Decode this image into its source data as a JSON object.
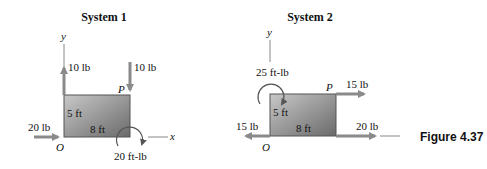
{
  "figure_label": "Figure 4.37",
  "systems": [
    {
      "title": "System 1",
      "axes": {
        "x": "x",
        "y": "y",
        "origin": "O",
        "point": "P"
      },
      "dims": {
        "height": "5 ft",
        "width": "8 ft"
      },
      "forces": [
        {
          "label": "10 lb",
          "at": "O",
          "direction": "up"
        },
        {
          "label": "10 lb",
          "at": "P",
          "direction": "down"
        },
        {
          "label": "20 lb",
          "at": "O",
          "direction": "right"
        }
      ],
      "moments": [
        {
          "label": "20 ft-lb",
          "at": "bottom-right",
          "sense": "clockwise"
        }
      ]
    },
    {
      "title": "System 2",
      "axes": {
        "x": "x",
        "y": "y",
        "origin": "O",
        "point": "P"
      },
      "dims": {
        "height": "5 ft",
        "width": "8 ft"
      },
      "forces": [
        {
          "label": "15 lb",
          "at": "P",
          "direction": "right"
        },
        {
          "label": "15 lb",
          "at": "O",
          "direction": "left"
        },
        {
          "label": "20 lb",
          "at": "bottom-right",
          "direction": "right"
        }
      ],
      "moments": [
        {
          "label": "25 ft-lb",
          "at": "O-top",
          "sense": "counterclockwise"
        }
      ]
    }
  ]
}
